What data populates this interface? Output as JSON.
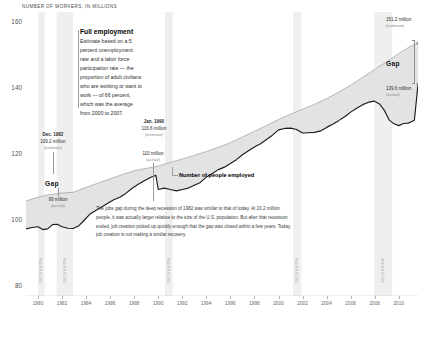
{
  "chart_data": {
    "type": "area",
    "title": "NUMBER OF WORKERS, IN MILLIONS",
    "xlabel": "",
    "ylabel": "NUMBER OF WORKERS, IN MILLIONS",
    "ylim": [
      80,
      160
    ],
    "xlim": [
      1979,
      2011.6
    ],
    "yticks": [
      "160",
      "140",
      "120",
      "100",
      "80"
    ],
    "ytick_values": [
      160,
      140,
      120,
      100,
      80
    ],
    "xticks": [
      "1980",
      "1982",
      "1984",
      "1986",
      "1988",
      "1990",
      "1992",
      "1994",
      "1996",
      "1998",
      "2000",
      "2002",
      "2004",
      "2006",
      "2008",
      "2010"
    ],
    "xtick_values": [
      1980,
      1982,
      1984,
      1986,
      1988,
      1990,
      1992,
      1994,
      1996,
      1998,
      2000,
      2002,
      2004,
      2006,
      2008,
      2010
    ],
    "grid": false,
    "legend_position": "inline-annotations",
    "series": [
      {
        "name": "Full employment",
        "style": "upper-bound-estimate",
        "values": [
          [
            1979.0,
            106.8
          ],
          [
            1980.0,
            107.8
          ],
          [
            1981.0,
            108.6
          ],
          [
            1982.0,
            109.0
          ],
          [
            1982.92,
            109.2
          ],
          [
            1984.0,
            110.6
          ],
          [
            1985.0,
            111.8
          ],
          [
            1986.0,
            113.0
          ],
          [
            1987.0,
            114.2
          ],
          [
            1988.0,
            115.3
          ],
          [
            1990.0,
            116.6
          ],
          [
            1991.0,
            117.6
          ],
          [
            1992.0,
            118.6
          ],
          [
            1993.0,
            119.6
          ],
          [
            1994.0,
            120.7
          ],
          [
            1995.0,
            121.9
          ],
          [
            1996.0,
            123.2
          ],
          [
            1997.0,
            124.8
          ],
          [
            1998.0,
            126.4
          ],
          [
            1999.0,
            128.0
          ],
          [
            2000.0,
            129.7
          ],
          [
            2001.0,
            131.2
          ],
          [
            2002.0,
            132.6
          ],
          [
            2003.0,
            134.0
          ],
          [
            2004.0,
            135.6
          ],
          [
            2005.0,
            137.4
          ],
          [
            2006.0,
            139.4
          ],
          [
            2007.0,
            141.6
          ],
          [
            2008.0,
            143.8
          ],
          [
            2009.0,
            146.0
          ],
          [
            2010.0,
            148.3
          ],
          [
            2011.0,
            150.4
          ],
          [
            2011.6,
            151.2
          ]
        ]
      },
      {
        "name": "Number of people employed",
        "style": "actual",
        "values": [
          [
            1979.0,
            98.9
          ],
          [
            1979.5,
            99.3
          ],
          [
            1980.0,
            99.5
          ],
          [
            1980.4,
            98.7
          ],
          [
            1980.8,
            98.9
          ],
          [
            1981.2,
            100.1
          ],
          [
            1981.6,
            100.2
          ],
          [
            1982.0,
            99.5
          ],
          [
            1982.5,
            99.1
          ],
          [
            1982.92,
            99.0
          ],
          [
            1983.4,
            99.8
          ],
          [
            1983.8,
            101.2
          ],
          [
            1984.3,
            103.0
          ],
          [
            1984.8,
            104.1
          ],
          [
            1985.3,
            105.1
          ],
          [
            1985.8,
            106.1
          ],
          [
            1986.3,
            107.1
          ],
          [
            1986.8,
            107.8
          ],
          [
            1987.3,
            108.9
          ],
          [
            1987.8,
            110.3
          ],
          [
            1988.3,
            111.4
          ],
          [
            1988.8,
            112.4
          ],
          [
            1989.3,
            113.3
          ],
          [
            1989.8,
            114.0
          ],
          [
            1990.0,
            110.0
          ],
          [
            1990.5,
            110.4
          ],
          [
            1991.0,
            110.0
          ],
          [
            1991.5,
            109.6
          ],
          [
            1992.0,
            110.0
          ],
          [
            1992.5,
            110.4
          ],
          [
            1993.0,
            111.2
          ],
          [
            1993.5,
            112.0
          ],
          [
            1994.0,
            113.5
          ],
          [
            1994.5,
            114.5
          ],
          [
            1995.0,
            115.6
          ],
          [
            1995.5,
            116.3
          ],
          [
            1996.0,
            117.3
          ],
          [
            1996.5,
            118.4
          ],
          [
            1997.0,
            119.8
          ],
          [
            1997.5,
            120.9
          ],
          [
            1998.0,
            122.0
          ],
          [
            1998.5,
            122.9
          ],
          [
            1999.0,
            124.1
          ],
          [
            1999.5,
            125.3
          ],
          [
            2000.0,
            126.8
          ],
          [
            2000.5,
            127.2
          ],
          [
            2001.0,
            127.3
          ],
          [
            2001.5,
            126.9
          ],
          [
            2002.0,
            125.9
          ],
          [
            2002.5,
            126.0
          ],
          [
            2003.0,
            126.1
          ],
          [
            2003.5,
            126.5
          ],
          [
            2004.0,
            127.5
          ],
          [
            2004.5,
            128.4
          ],
          [
            2005.0,
            129.4
          ],
          [
            2005.5,
            130.5
          ],
          [
            2006.0,
            131.8
          ],
          [
            2006.5,
            132.9
          ],
          [
            2007.0,
            133.9
          ],
          [
            2007.5,
            134.6
          ],
          [
            2007.95,
            134.9
          ],
          [
            2008.4,
            134.1
          ],
          [
            2008.8,
            132.3
          ],
          [
            2009.2,
            129.6
          ],
          [
            2009.6,
            128.5
          ],
          [
            2010.0,
            128.0
          ],
          [
            2010.4,
            128.6
          ],
          [
            2010.8,
            128.7
          ],
          [
            2011.0,
            129.0
          ],
          [
            2011.3,
            129.5
          ],
          [
            2011.6,
            139.6
          ]
        ]
      }
    ],
    "recessions": [
      {
        "label": "RECESSION",
        "start": 1980.0,
        "end": 1980.55
      },
      {
        "label": "RECESSION",
        "start": 1981.55,
        "end": 1982.9
      },
      {
        "label": "RECESSION",
        "start": 1990.55,
        "end": 1991.2
      },
      {
        "label": "RECESSION",
        "start": 2001.2,
        "end": 2001.9
      },
      {
        "label": "RECESSION",
        "start": 2007.95,
        "end": 2009.45
      }
    ],
    "annotations": [
      {
        "name": "full-employment",
        "title": "Full employment",
        "text": "Estimate based on a 5 percent unemployment rate and a labor force participation rate — the proportion of adult civilians who are working or want to work — of 66 percent, which was the average from 2000 to 2007."
      },
      {
        "name": "dec-1982",
        "line1": "Dec. 1982",
        "line2": "109.2 million",
        "line3": "(estimate)"
      },
      {
        "name": "jan-1990",
        "line1": "Jan. 1990",
        "line2": "116.6 million",
        "line3": "(estimate)"
      },
      {
        "name": "actual-110",
        "line1": "",
        "line2": "110 million",
        "line3": "(actual)"
      },
      {
        "name": "actual-99",
        "line1": "",
        "line2": "99 million",
        "line3": "(actual)"
      },
      {
        "name": "latest-estimate",
        "line1": "",
        "line2": "151.2 million",
        "line3": "(estimate)"
      },
      {
        "name": "latest-actual",
        "line1": "",
        "line2": "139.6 million",
        "line3": "(actual)"
      },
      {
        "name": "gap-1982",
        "text": "Gap"
      },
      {
        "name": "gap-today",
        "text": "Gap"
      },
      {
        "name": "series-actual",
        "text": "Number of people employed"
      }
    ],
    "blurb": "The jobs gap during the deep recession of 1982 was similar to that of today. At 10.2 million people, it was actually larger relative to the size of the U.S. population. But after that recession ended, job creation picked up quickly enough that the gap was closed within a few years. Today, job creation is not making a similar recovery.",
    "colors": {
      "gap_fill": "#e3e3e3",
      "actual_line": "#1c1c1c",
      "estimate_line": "#9e9e9e",
      "recession_band": "#efefef",
      "axis": "#bdbdbd",
      "text": "#333333"
    }
  },
  "labels": {
    "y_160": "160",
    "y_140": "140",
    "y_120": "120",
    "y_100": "100",
    "y_80": "80",
    "gap_left": "Gap",
    "gap_right": "Gap",
    "series_actual": "Number of people employed",
    "full_employment_title": "Full employment",
    "full_employment_body": "Estimate based on a 5 percent unemployment rate and a labor force participation rate — the proportion of adult civilians who are working or want to work — of 66 percent, which was the average from 2000 to 2007.",
    "dec1982_l1": "Dec. 1982",
    "dec1982_l2": "109.2 million",
    "dec1982_l3": "(estimate)",
    "jan1990_l1": "Jan. 1990",
    "jan1990_l2": "116.6 million",
    "jan1990_l3": "(estimate)",
    "actual110_l2": "110 million",
    "actual110_l3": "(actual)",
    "actual99_l2": "99 million",
    "actual99_l3": "(actual)",
    "est1512_l2": "151.2 million",
    "est1512_l3": "(estimate)",
    "act1396_l2": "139.6 million",
    "act1396_l3": "(actual)",
    "recession": "RECESSION",
    "axis_title": "NUMBER OF WORKERS, IN MILLIONS"
  }
}
